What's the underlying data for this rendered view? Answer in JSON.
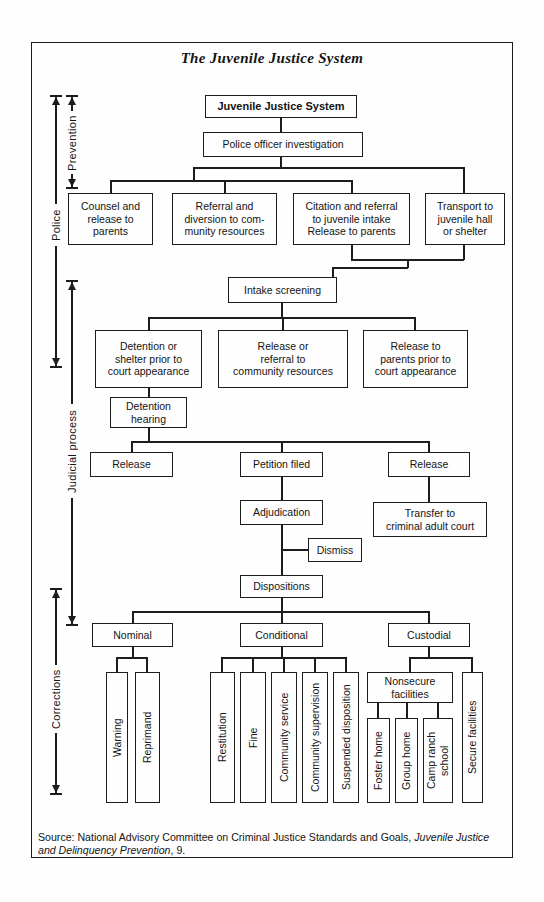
{
  "figure": {
    "title": "The Juvenile Justice System",
    "source": {
      "prefix": "Source: National Advisory Committee on Criminal Justice Standards and Goals, ",
      "italic": "Juvenile Justice and Delinquency Prevention",
      "suffix": ", 9."
    }
  },
  "colors": {
    "ink": "#1c1c1c",
    "background": "#fefefe"
  },
  "sections": {
    "prevention": {
      "label": "Prevention"
    },
    "police": {
      "label": "Police"
    },
    "judicial_process": {
      "label": "Judicial process"
    },
    "corrections": {
      "label": "Corrections"
    }
  },
  "nodes": {
    "root": "Juvenile Justice System",
    "police_investigation": "Police officer investigation",
    "counsel_release": "Counsel and\nrelease to\nparents",
    "referral_diversion": "Referral and\ndiversion to com-\nmunity resources",
    "citation_referral": "Citation and referral\nto juvenile intake\nRelease to parents",
    "transport": "Transport to\njuvenile hall\nor shelter",
    "intake_screening": "Intake screening",
    "detention_shelter": "Detention or\nshelter prior to\ncourt appearance",
    "release_referral": "Release or\nreferral to\ncommunity resources",
    "release_parents": "Release to\nparents prior to\ncourt appearance",
    "detention_hearing": "Detention\nhearing",
    "release_left": "Release",
    "petition_filed": "Petition filed",
    "release_right": "Release",
    "adjudication": "Adjudication",
    "transfer_adult_court": "Transfer to\ncriminal adult court",
    "dismiss": "Dismiss",
    "dispositions": "Dispositions",
    "nominal": "Nominal",
    "conditional": "Conditional",
    "custodial": "Custodial",
    "warning": "Warning",
    "reprimand": "Reprimand",
    "restitution": "Restitution",
    "fine": "Fine",
    "community_service": "Community service",
    "community_supervision": "Community supervision",
    "suspended_disposition": "Suspended disposition",
    "nonsecure_facilities": "Nonsecure\nfacilities",
    "foster_home": "Foster home",
    "group_home": "Group home",
    "camp_ranch_school": "Camp ranch\nschool",
    "secure_facilities": "Secure facilities"
  }
}
